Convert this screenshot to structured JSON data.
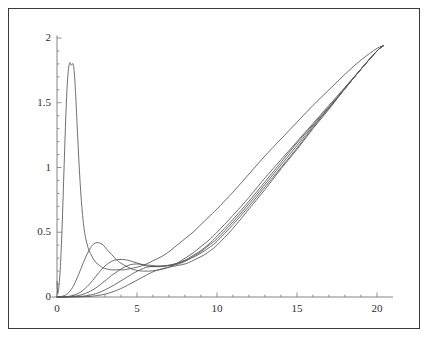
{
  "figure": {
    "background_color": "#ffffff",
    "frame_color": "#3a3a3a",
    "curve_color": "#555555",
    "axis_color": "#777777",
    "title": "",
    "caption": ""
  },
  "chart_data": {
    "type": "line",
    "title": "",
    "subtitle": "",
    "xlabel": "",
    "ylabel": "",
    "xlim": [
      -0.4,
      21.0
    ],
    "ylim": [
      0,
      2.05
    ],
    "grid": false,
    "legend": false,
    "legend_position": "none",
    "axis_ticks": {
      "x_major": [
        0,
        5,
        10,
        15,
        20
      ],
      "x_major_labels": [
        "0",
        "5",
        "10",
        "15",
        "20"
      ],
      "x_minor_step": 1,
      "y_major": [
        0,
        0.5,
        1,
        1.5,
        2
      ],
      "y_major_labels": [
        "0",
        "0.5",
        "1",
        "1.5",
        "2"
      ],
      "y_minor_step": 0.1
    },
    "annotations": [],
    "series": [
      {
        "name": "curve-1",
        "peak_x": 1.0,
        "peak_y": 1.8,
        "x": [
          0.0,
          0.05,
          0.1,
          0.15,
          0.2,
          0.25,
          0.3,
          0.35,
          0.4,
          0.45,
          0.5,
          0.55,
          0.6,
          0.65,
          0.7,
          0.75,
          0.8,
          0.85,
          0.9,
          0.95,
          1.0,
          1.05,
          1.1,
          1.15,
          1.2,
          1.3,
          1.4,
          1.5,
          1.6,
          1.7,
          1.8,
          1.9,
          2.0,
          2.2,
          2.4,
          2.6,
          2.8,
          3.0,
          3.4,
          3.8,
          4.2,
          4.6,
          5.0,
          5.5,
          6.0,
          6.5,
          7.0,
          7.5,
          8.0,
          8.5,
          9.0,
          9.5,
          10.0,
          11.0,
          12.0,
          13.0,
          14.0,
          15.0,
          16.0,
          17.0,
          18.0,
          19.0,
          20.0,
          20.4
        ],
        "y": [
          0.12,
          0.03,
          0.06,
          0.12,
          0.21,
          0.33,
          0.48,
          0.65,
          0.84,
          1.03,
          1.22,
          1.39,
          1.54,
          1.66,
          1.74,
          1.79,
          1.81,
          1.8,
          1.79,
          1.8,
          1.8,
          1.77,
          1.7,
          1.6,
          1.48,
          1.22,
          0.98,
          0.78,
          0.63,
          0.52,
          0.45,
          0.4,
          0.36,
          0.31,
          0.27,
          0.25,
          0.23,
          0.22,
          0.21,
          0.21,
          0.21,
          0.22,
          0.23,
          0.25,
          0.28,
          0.31,
          0.35,
          0.4,
          0.45,
          0.5,
          0.56,
          0.62,
          0.68,
          0.81,
          0.95,
          1.09,
          1.22,
          1.35,
          1.48,
          1.6,
          1.72,
          1.83,
          1.92,
          1.94
        ]
      },
      {
        "name": "curve-2",
        "peak_x": 2.5,
        "peak_y": 0.42,
        "x": [
          0.0,
          0.3,
          0.6,
          0.9,
          1.2,
          1.5,
          1.8,
          2.1,
          2.3,
          2.5,
          2.7,
          2.9,
          3.1,
          3.4,
          3.7,
          4.0,
          4.3,
          4.6,
          5.0,
          5.4,
          5.8,
          6.2,
          6.6,
          7.0,
          7.5,
          8.0,
          8.5,
          9.0,
          9.5,
          10.0,
          11.0,
          12.0,
          13.0,
          14.0,
          15.0,
          16.0,
          17.0,
          18.0,
          19.0,
          20.0,
          20.4
        ],
        "y": [
          0.0,
          0.005,
          0.02,
          0.06,
          0.13,
          0.22,
          0.31,
          0.38,
          0.41,
          0.42,
          0.415,
          0.4,
          0.37,
          0.33,
          0.29,
          0.26,
          0.24,
          0.22,
          0.205,
          0.2,
          0.2,
          0.205,
          0.215,
          0.23,
          0.26,
          0.3,
          0.34,
          0.39,
          0.44,
          0.5,
          0.63,
          0.77,
          0.92,
          1.06,
          1.2,
          1.34,
          1.48,
          1.62,
          1.76,
          1.9,
          1.94
        ]
      },
      {
        "name": "curve-3",
        "peak_x": 3.6,
        "peak_y": 0.29,
        "x": [
          0.0,
          0.5,
          1.0,
          1.5,
          2.0,
          2.4,
          2.8,
          3.2,
          3.6,
          4.0,
          4.4,
          4.8,
          5.2,
          5.6,
          6.0,
          6.4,
          6.8,
          7.2,
          7.6,
          8.0,
          8.5,
          9.0,
          9.5,
          10.0,
          11.0,
          12.0,
          13.0,
          14.0,
          15.0,
          16.0,
          17.0,
          18.0,
          19.0,
          20.0,
          20.4
        ],
        "y": [
          0.0,
          0.002,
          0.012,
          0.04,
          0.095,
          0.155,
          0.215,
          0.26,
          0.285,
          0.29,
          0.285,
          0.27,
          0.255,
          0.24,
          0.235,
          0.235,
          0.24,
          0.25,
          0.265,
          0.285,
          0.32,
          0.36,
          0.41,
          0.47,
          0.6,
          0.74,
          0.89,
          1.04,
          1.19,
          1.33,
          1.47,
          1.61,
          1.76,
          1.9,
          1.94
        ]
      },
      {
        "name": "curve-4",
        "peak_x": 4.5,
        "peak_y": 0.255,
        "x": [
          0.0,
          0.6,
          1.2,
          1.8,
          2.4,
          3.0,
          3.4,
          3.8,
          4.2,
          4.6,
          5.0,
          5.4,
          5.8,
          6.2,
          6.6,
          7.0,
          7.4,
          7.8,
          8.2,
          8.6,
          9.0,
          9.5,
          10.0,
          11.0,
          12.0,
          13.0,
          14.0,
          15.0,
          16.0,
          17.0,
          18.0,
          19.0,
          20.0,
          20.4
        ],
        "y": [
          0.0,
          0.001,
          0.008,
          0.028,
          0.068,
          0.125,
          0.165,
          0.2,
          0.23,
          0.25,
          0.255,
          0.25,
          0.245,
          0.24,
          0.24,
          0.245,
          0.255,
          0.27,
          0.29,
          0.32,
          0.35,
          0.4,
          0.45,
          0.58,
          0.72,
          0.87,
          1.02,
          1.17,
          1.32,
          1.46,
          1.61,
          1.76,
          1.9,
          1.94
        ]
      },
      {
        "name": "curve-5",
        "peak_x": 5.6,
        "peak_y": 0.235,
        "x": [
          0.0,
          0.8,
          1.6,
          2.4,
          3.0,
          3.6,
          4.2,
          4.8,
          5.2,
          5.6,
          6.0,
          6.4,
          6.8,
          7.2,
          7.6,
          8.0,
          8.4,
          8.8,
          9.2,
          9.6,
          10.0,
          11.0,
          12.0,
          13.0,
          14.0,
          15.0,
          16.0,
          17.0,
          18.0,
          19.0,
          20.0,
          20.4
        ],
        "y": [
          0.0,
          0.001,
          0.006,
          0.025,
          0.055,
          0.095,
          0.14,
          0.185,
          0.21,
          0.23,
          0.235,
          0.235,
          0.24,
          0.245,
          0.255,
          0.275,
          0.3,
          0.325,
          0.355,
          0.39,
          0.43,
          0.56,
          0.7,
          0.85,
          1.0,
          1.15,
          1.31,
          1.46,
          1.61,
          1.76,
          1.9,
          1.94
        ]
      },
      {
        "name": "curve-6",
        "peak_x": 6.8,
        "peak_y": 0.23,
        "x": [
          0.0,
          1.0,
          2.0,
          3.0,
          3.8,
          4.4,
          5.0,
          5.6,
          6.2,
          6.8,
          7.2,
          7.6,
          8.0,
          8.4,
          8.8,
          9.2,
          9.6,
          10.0,
          11.0,
          12.0,
          13.0,
          14.0,
          15.0,
          16.0,
          17.0,
          18.0,
          19.0,
          20.0,
          20.4
        ],
        "y": [
          0.0,
          0.0005,
          0.004,
          0.022,
          0.055,
          0.09,
          0.13,
          0.17,
          0.205,
          0.225,
          0.235,
          0.245,
          0.255,
          0.275,
          0.3,
          0.325,
          0.36,
          0.4,
          0.53,
          0.68,
          0.83,
          0.99,
          1.14,
          1.3,
          1.45,
          1.61,
          1.76,
          1.9,
          1.94
        ]
      }
    ]
  }
}
